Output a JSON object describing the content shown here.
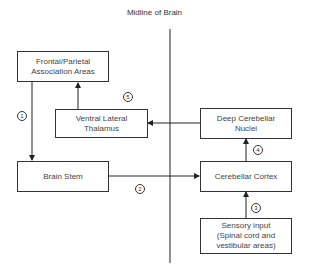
{
  "title": "Midline of Brain",
  "boxes": {
    "frontal_parietal": "Frontal/Parietal\nAssociation Areas",
    "vl_thalamus": "Ventral Lateral\nThalamus",
    "deep_cerebellar": "Deep Cerebellar\nNuclei",
    "brain_stem": "Brain Stem",
    "cerebellar_cortex": "Cerebellar Cortex",
    "sensory_input": "Sensory input\n(Spinal cord and\nvestibular areas)"
  },
  "steps": {
    "s1": "1",
    "s2": "2",
    "s3": "3",
    "s4": "4",
    "s5": "5"
  },
  "connections": [
    {
      "step": "1",
      "from": "Frontal/Parietal Association Areas",
      "to": "Brain Stem"
    },
    {
      "step": "2",
      "from": "Brain Stem",
      "to": "Cerebellar Cortex"
    },
    {
      "step": "3",
      "from": "Sensory input",
      "to": "Cerebellar Cortex"
    },
    {
      "step": "4",
      "from": "Cerebellar Cortex",
      "to": "Deep Cerebellar Nuclei"
    },
    {
      "step": "5",
      "from": "Deep Cerebellar Nuclei",
      "to": "Ventral Lateral Thalamus"
    },
    {
      "step": "",
      "from": "Ventral Lateral Thalamus",
      "to": "Frontal/Parietal Association Areas"
    }
  ]
}
